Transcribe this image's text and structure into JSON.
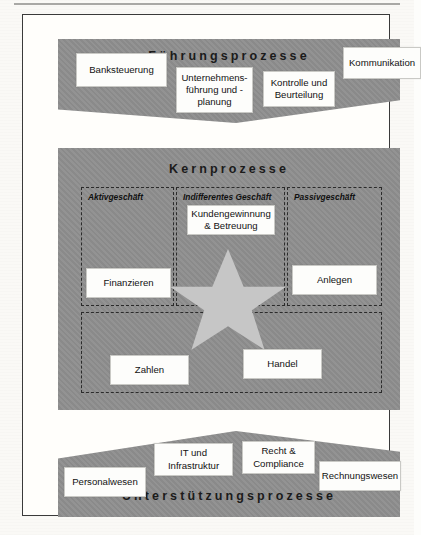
{
  "diagram": {
    "bands": {
      "top": {
        "label": "Führungsprozesse",
        "shape": "chevron-down",
        "color": "#8e8e8e"
      },
      "middle": {
        "label": "Kernprozesse",
        "shape": "rectangle",
        "color": "#8e8e8e"
      },
      "bottom": {
        "label": "Unterstützungsprozesse",
        "shape": "chevron-up",
        "color": "#8e8e8e"
      }
    },
    "management_processes": [
      {
        "label": "Banksteuerung"
      },
      {
        "label": "Unternehmens-\nführung und -\nplanung"
      },
      {
        "label": "Kontrolle und\nBeurteilung"
      },
      {
        "label": "Kommunikation"
      }
    ],
    "core_groups": [
      {
        "label": "Aktivgeschäft"
      },
      {
        "label": "Indifferentes Geschäft"
      },
      {
        "label": "Passivgeschäft"
      }
    ],
    "core_processes": [
      {
        "label": "Kundengewinnung\n& Betreuung",
        "group": "Indifferentes Geschäft"
      },
      {
        "label": "Finanzieren",
        "group": "Aktivgeschäft"
      },
      {
        "label": "Anlegen",
        "group": "Passivgeschäft"
      },
      {
        "label": "Zahlen",
        "group": "Indifferentes Geschäft"
      },
      {
        "label": "Handel",
        "group": "Indifferentes Geschäft"
      }
    ],
    "support_processes": [
      {
        "label": "Personalwesen"
      },
      {
        "label": "IT und\nInfrastruktur"
      },
      {
        "label": "Recht &\nCompliance"
      },
      {
        "label": "Rechnungswesen"
      }
    ],
    "decoration": {
      "star": "five-pointed-star",
      "star_color": "#c6c6c6"
    }
  }
}
